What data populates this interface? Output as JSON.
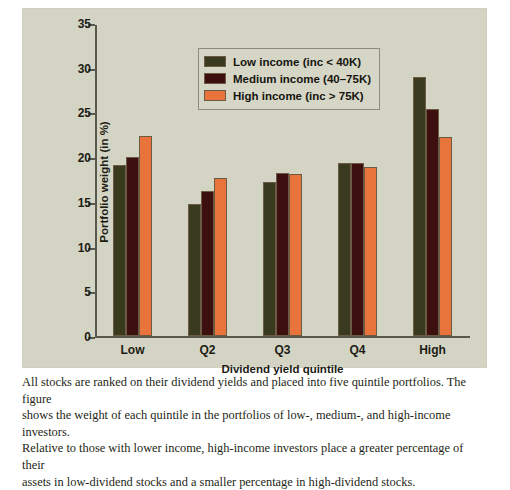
{
  "chart_data": {
    "type": "bar",
    "title": "",
    "xlabel": "Dividend yield quintile",
    "ylabel": "Portfolio weight (in %)",
    "categories": [
      "Low",
      "Q2",
      "Q3",
      "Q4",
      "High"
    ],
    "series": [
      {
        "name": "Low income (inc < 40K)",
        "color": "#3a3a1e",
        "values": [
          19.1,
          14.8,
          17.2,
          19.3,
          29.0
        ]
      },
      {
        "name": "Medium income (40–75K)",
        "color": "#3d0f0f",
        "values": [
          20.0,
          16.2,
          18.2,
          19.4,
          25.4
        ]
      },
      {
        "name": "High income (inc > 75K)",
        "color": "#e8743c",
        "values": [
          22.4,
          17.7,
          18.1,
          18.9,
          22.3
        ]
      }
    ],
    "ylim": [
      0,
      35
    ],
    "yticks": [
      0,
      5,
      10,
      15,
      20,
      25,
      30,
      35
    ],
    "grid": false,
    "legend_position": "top-left"
  },
  "legend": {
    "items": [
      {
        "label": "Low income (inc < 40K)"
      },
      {
        "label": "Medium income (40–75K)"
      },
      {
        "label": "High income (inc > 75K)"
      }
    ]
  },
  "caption": {
    "line1": "All stocks are ranked on their dividend yields and placed into five quintile portfolios. The figure",
    "line2": "shows the weight of each quintile in the portfolios of low-, medium-, and high-income investors.",
    "line3": "Relative to those with lower income, high-income investors place a greater percentage of their",
    "line4": "assets in low-dividend stocks and a smaller percentage in high-dividend stocks."
  },
  "colors": {
    "panel_background": "#d4d4c4",
    "page_background": "#ffffff",
    "axis": "#58584c",
    "bar_outline": "#6b5a44",
    "text": "#1c1c14"
  }
}
